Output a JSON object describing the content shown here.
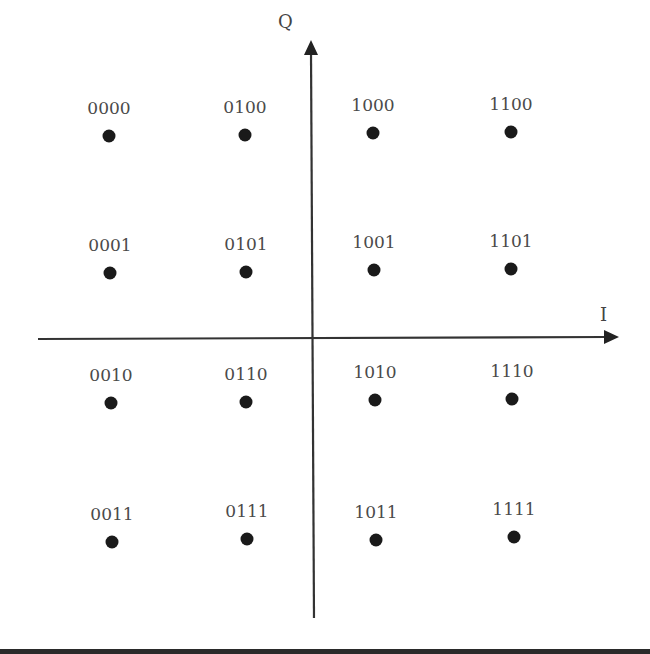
{
  "axes": {
    "i_label": "I",
    "q_label": "Q",
    "origin": [
      312,
      338
    ],
    "color": "#333333"
  },
  "points": [
    {
      "label": "0000",
      "x": 109,
      "y": 136
    },
    {
      "label": "0100",
      "x": 245,
      "y": 135
    },
    {
      "label": "1000",
      "x": 373,
      "y": 133
    },
    {
      "label": "1100",
      "x": 511,
      "y": 132
    },
    {
      "label": "0001",
      "x": 110,
      "y": 273
    },
    {
      "label": "0101",
      "x": 246,
      "y": 272
    },
    {
      "label": "1001",
      "x": 374,
      "y": 270
    },
    {
      "label": "1101",
      "x": 511,
      "y": 269
    },
    {
      "label": "0010",
      "x": 111,
      "y": 403
    },
    {
      "label": "0110",
      "x": 246,
      "y": 402
    },
    {
      "label": "1010",
      "x": 375,
      "y": 400
    },
    {
      "label": "1110",
      "x": 512,
      "y": 399
    },
    {
      "label": "0011",
      "x": 112,
      "y": 542
    },
    {
      "label": "0111",
      "x": 247,
      "y": 539
    },
    {
      "label": "1011",
      "x": 376,
      "y": 540
    },
    {
      "label": "1111",
      "x": 514,
      "y": 537
    }
  ],
  "dot_color": "#1a1a1a"
}
